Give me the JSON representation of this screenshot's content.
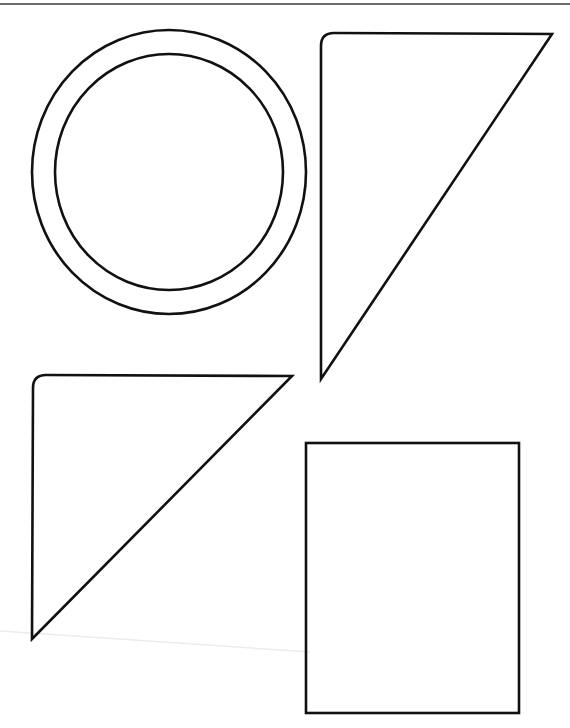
{
  "document": {
    "type": "shapes worksheet (scanned)",
    "header_text": "",
    "colors": {
      "stroke": "#111111",
      "header_rule": "#6d6d6d",
      "artifact_line": "#ececec",
      "background": "#ffffff"
    }
  },
  "shapes": [
    {
      "name": "ring",
      "kind": "double-circle",
      "outer": {
        "cx": 169,
        "cy": 172,
        "rx": 137,
        "ry": 142
      },
      "inner": {
        "cx": 169,
        "cy": 172,
        "rx": 114,
        "ry": 118
      }
    },
    {
      "name": "right-triangle-top",
      "kind": "right-triangle",
      "vertices": [
        [
          321,
          379
        ],
        [
          321,
          33
        ],
        [
          552,
          34
        ]
      ],
      "rounded_corner": "top-left"
    },
    {
      "name": "right-triangle-bottom",
      "kind": "right-triangle",
      "vertices": [
        [
          32,
          639
        ],
        [
          33,
          375
        ],
        [
          292,
          376
        ]
      ],
      "rounded_corner": "top-left"
    },
    {
      "name": "rectangle",
      "kind": "rectangle",
      "x": 306,
      "y": 443,
      "width": 213,
      "height": 270
    }
  ]
}
